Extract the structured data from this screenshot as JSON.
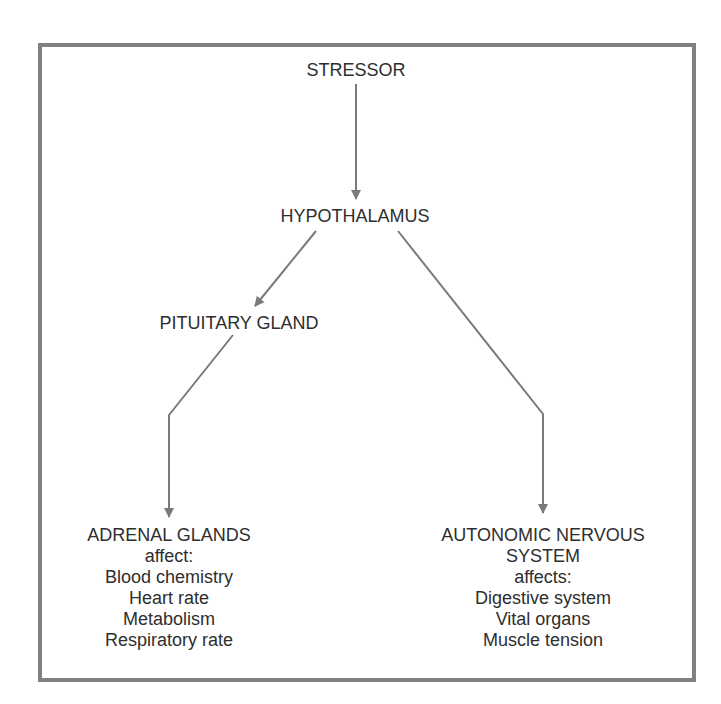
{
  "diagram": {
    "type": "flowchart",
    "colors": {
      "border": "#808080",
      "arrow": "#7a7a7a",
      "text": "#2e2e2e",
      "background": "#ffffff"
    },
    "nodes": {
      "stressor": {
        "label": "STRESSOR"
      },
      "hypothalamus": {
        "label": "HYPOTHALAMUS"
      },
      "pituitary": {
        "label": "PITUITARY GLAND"
      },
      "adrenal": {
        "title": "ADRENAL GLANDS",
        "verb": "affect:",
        "effects": [
          "Blood chemistry",
          "Heart rate",
          "Metabolism",
          "Respiratory rate"
        ]
      },
      "autonomic": {
        "title_line1": "AUTONOMIC NERVOUS",
        "title_line2": "SYSTEM",
        "verb": "affects:",
        "effects": [
          "Digestive system",
          "Vital organs",
          "Muscle tension"
        ]
      }
    },
    "edges": [
      {
        "from": "STRESSOR",
        "to": "HYPOTHALAMUS"
      },
      {
        "from": "HYPOTHALAMUS",
        "to": "PITUITARY GLAND"
      },
      {
        "from": "HYPOTHALAMUS",
        "to": "AUTONOMIC NERVOUS SYSTEM"
      },
      {
        "from": "PITUITARY GLAND",
        "to": "ADRENAL GLANDS"
      }
    ]
  }
}
